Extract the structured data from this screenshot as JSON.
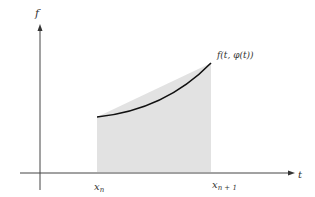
{
  "diagram": {
    "y_axis_label": "f",
    "x_axis_label": "t",
    "curve_label": "f(t, φ(t))",
    "x_left_label": "x",
    "x_left_sub": "n",
    "x_right_label": "x",
    "x_right_sub": "n + 1",
    "colors": {
      "axis": "#444444",
      "curve": "#111111",
      "shade": "#e2e2e2",
      "text": "#333333"
    }
  }
}
